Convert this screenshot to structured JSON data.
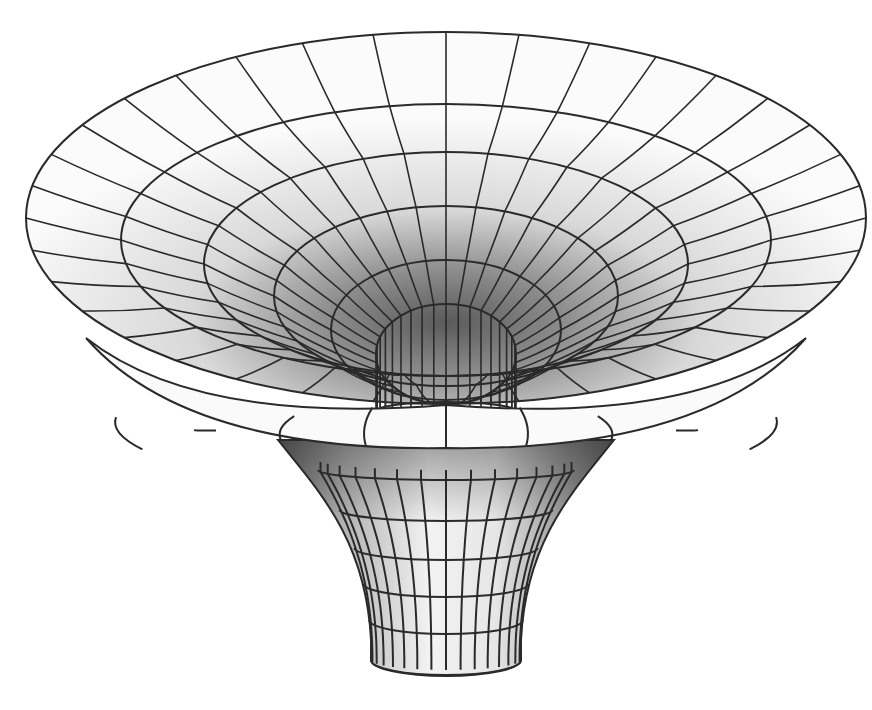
{
  "figure": {
    "corner_mark": "",
    "colors": {
      "line": "#2a2a2a",
      "surface_light": "#fafafa",
      "surface_mid": "#cfcfcf",
      "surface_dark": "#6e6e6e",
      "background": "#ffffff"
    },
    "bowl": {
      "cx": 446,
      "outer": {
        "cy": 218,
        "rx": 420,
        "ry": 186
      },
      "rings": [
        {
          "cy": 240,
          "rx": 325,
          "ry": 136
        },
        {
          "cy": 264,
          "rx": 242,
          "ry": 112
        },
        {
          "cy": 296,
          "rx": 172,
          "ry": 90
        },
        {
          "cy": 330,
          "rx": 115,
          "ry": 70
        },
        {
          "cy": 354,
          "rx": 70,
          "ry": 50
        }
      ],
      "throat": {
        "cy": 411,
        "rx": 70,
        "ry": 9
      },
      "meridian_count": 36
    },
    "lip": {
      "top_y": 395,
      "bottom_y": 442,
      "cx": 446,
      "rx_top": 430,
      "rx_bottom": 260
    },
    "neck": {
      "cx": 446,
      "top": {
        "y": 470,
        "rx": 128,
        "ry": 14
      },
      "bottom": {
        "y": 660,
        "rx": 75,
        "ry": 16
      },
      "rings_y": [
        470,
        510,
        548,
        584,
        620,
        660
      ],
      "columns": 16
    }
  }
}
